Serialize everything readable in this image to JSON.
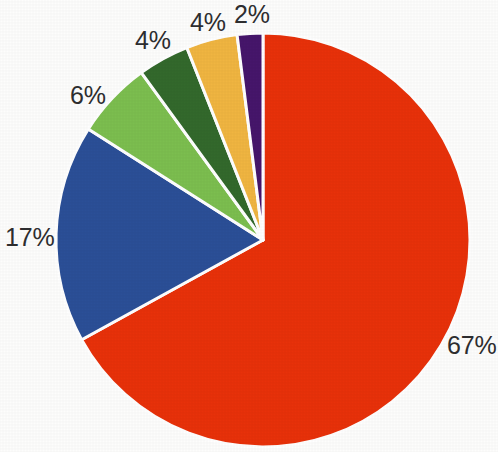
{
  "chart_data": {
    "type": "pie",
    "title": "",
    "subtitle": "",
    "xlabel": "",
    "ylabel": "",
    "legend_position": "none",
    "grid": false,
    "labels_shown": true,
    "label_format": "percent",
    "start_angle_deg": 0,
    "direction": "clockwise",
    "categories": [
      "Slice 1",
      "Slice 2",
      "Slice 3",
      "Slice 4",
      "Slice 5",
      "Slice 6"
    ],
    "values": [
      67,
      17,
      6,
      4,
      4,
      2
    ],
    "data_labels": [
      "67%",
      "17%",
      "6%",
      "4%",
      "4%",
      "2%"
    ],
    "colors": [
      "#e8310a",
      "#2b4f97",
      "#7cbe4f",
      "#33692c",
      "#f0b541",
      "#46166b"
    ],
    "slice_separator_color": "#ffffff",
    "background_color": "#fdfdfc",
    "label_text_color": "#2e2e30",
    "total": 100,
    "units": "percent"
  },
  "geometry": {
    "center_x": 263,
    "center_y": 240,
    "radius": 207
  }
}
